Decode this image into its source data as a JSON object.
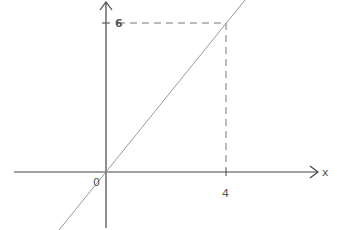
{
  "diagram": {
    "x_axis_label": "x",
    "origin_label": "0",
    "x_tick_label": "4",
    "y_tick_label": "6",
    "line_color": "#888888",
    "axis_color": "#333333"
  }
}
